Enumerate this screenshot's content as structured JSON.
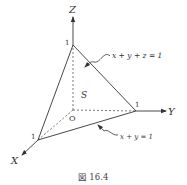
{
  "figure": {
    "caption": "図 16.4",
    "axes": {
      "x_label": "X",
      "y_label": "Y",
      "z_label": "Z",
      "origin_label": "O"
    },
    "intercepts": {
      "x": "1",
      "y": "1",
      "z": "1"
    },
    "region_label": "S",
    "annotations": {
      "plane": "x + y + z = 1",
      "line": "x + y = 1"
    }
  }
}
